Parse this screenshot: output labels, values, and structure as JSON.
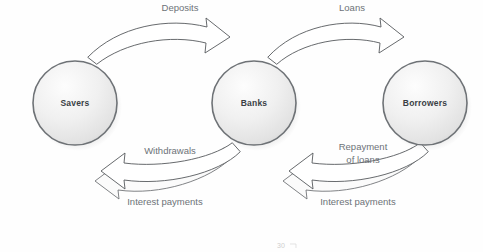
{
  "diagram": {
    "nodes": [
      {
        "id": "savers",
        "label": "Savers",
        "cx": 75,
        "cy": 103,
        "r": 42
      },
      {
        "id": "banks",
        "label": "Banks",
        "cx": 254,
        "cy": 103,
        "r": 42
      },
      {
        "id": "borrowers",
        "label": "Borrowers",
        "cx": 425,
        "cy": 103,
        "r": 42
      }
    ],
    "flows": [
      {
        "id": "deposits",
        "label": "Deposits",
        "from": "savers",
        "to": "banks",
        "position": "top-left",
        "x": 180,
        "y": 11
      },
      {
        "id": "loans",
        "label": "Loans",
        "from": "banks",
        "to": "borrowers",
        "position": "top-right",
        "x": 352,
        "y": 11
      },
      {
        "id": "withdrawals",
        "label": "Withdrawals",
        "from": "banks",
        "to": "savers",
        "position": "bottom-left",
        "x": 170,
        "y": 154
      },
      {
        "id": "repayment-of-loans",
        "label": "Repayment",
        "label2": "of loans",
        "from": "borrowers",
        "to": "banks",
        "position": "bottom-right",
        "x": 363,
        "y": 150
      },
      {
        "id": "interest-payments-left",
        "label": "Interest payments",
        "from": "banks",
        "to": "savers",
        "position": "bottom-left-outer",
        "x": 165,
        "y": 205
      },
      {
        "id": "interest-payments-right",
        "label": "Interest payments",
        "from": "borrowers",
        "to": "banks",
        "position": "bottom-right-outer",
        "x": 358,
        "y": 205
      }
    ],
    "artifact": {
      "page_number": "30",
      "x": 281,
      "y": 248
    },
    "colors": {
      "node_fill": "#eeeeee",
      "node_stroke": "#6e7276",
      "node_text": "#3a3f45",
      "flow_text": "#6d7278",
      "arrow_stroke": "#56595c",
      "background": "#fefefe"
    }
  }
}
